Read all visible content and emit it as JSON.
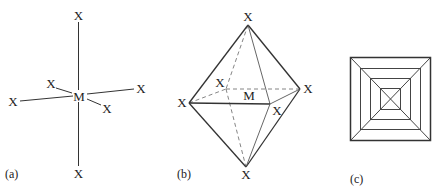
{
  "figure": {
    "panels": [
      {
        "id": "a",
        "caption": "(a)",
        "description": "ball-and-stick style octahedral coordination",
        "center_label": "M",
        "ligand_labels": [
          "X",
          "X",
          "X",
          "X",
          "X",
          "X"
        ]
      },
      {
        "id": "b",
        "caption": "(b)",
        "description": "octahedron polyhedral representation with hidden edges dashed",
        "center_label": "M",
        "vertex_labels": [
          "X",
          "X",
          "X",
          "X",
          "X",
          "X"
        ]
      },
      {
        "id": "c",
        "caption": "(c)",
        "description": "octahedron viewed down a four-fold axis, shown as nested squares with diagonals",
        "nested_squares": 4
      }
    ]
  },
  "colors": {
    "line": "#333333",
    "hidden_edge": "#777777",
    "text": "#222222",
    "background": "#ffffff"
  }
}
